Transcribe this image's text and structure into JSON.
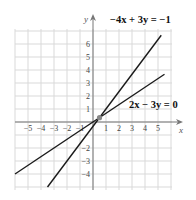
{
  "chart_data": {
    "type": "line",
    "title": "",
    "xlabel": "x",
    "ylabel": "y",
    "xlim": [
      -6,
      6
    ],
    "ylim": [
      -5,
      7
    ],
    "grid": true,
    "x_ticks": [
      -5,
      -4,
      -3,
      -2,
      -1,
      1,
      2,
      3,
      4,
      5
    ],
    "y_ticks": [
      -4,
      -3,
      -2,
      -1,
      1,
      2,
      3,
      4,
      5,
      6
    ],
    "x_tick_labels": [
      "−5",
      "−4",
      "−3",
      "−2",
      "−1",
      "1",
      "2",
      "3",
      "4",
      "5"
    ],
    "y_tick_labels": [
      "−4",
      "−3",
      "−2",
      "",
      "1",
      "2",
      "3",
      "4",
      "5",
      "6"
    ],
    "series": [
      {
        "name": "−4x + 3y = −1",
        "equation": "y = (4x − 1)/3",
        "slope": 1.3333,
        "intercept": -0.3333,
        "x": [
          -3.5,
          5.25
        ],
        "y": [
          -5.0,
          6.67
        ]
      },
      {
        "name": "2x − 3y = 0",
        "equation": "y = 2x/3",
        "slope": 0.6667,
        "intercept": 0,
        "x": [
          -6,
          5.5
        ],
        "y": [
          -4.0,
          3.67
        ]
      }
    ],
    "annotations": [
      {
        "text": "−4x + 3y = −1",
        "near": [
          6,
          7
        ]
      },
      {
        "text": "2x − 3y = 0",
        "near": [
          6,
          1
        ]
      }
    ],
    "intersection_point": {
      "x": 0.5,
      "y": 0.3333,
      "color": "#888888"
    }
  },
  "labels": {
    "eq1": "−4x + 3y = −1",
    "eq2": "2x − 3y = 0",
    "x_axis": "x",
    "y_axis": "y"
  },
  "colors": {
    "grid": "#d9d9d9",
    "axis": "#777777",
    "line": "#1a1a1a",
    "point": "#888888"
  }
}
